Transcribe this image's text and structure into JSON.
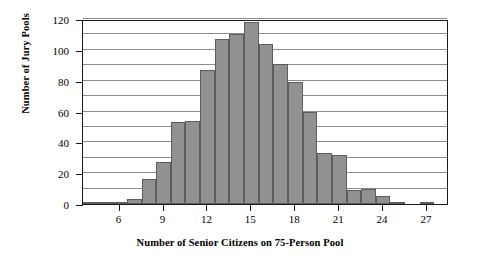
{
  "chart_data": {
    "type": "bar",
    "title": "",
    "xlabel": "Number of Senior Citizens on 75-Person Pool",
    "ylabel": "Number of Jury Pools",
    "xlim": [
      3.5,
      28.5
    ],
    "ylim": [
      0,
      120
    ],
    "grid": true,
    "legend": "none",
    "bar_color": "#919191",
    "bar_edge_color": "#5d5d5d",
    "axis_color": "#1a1a1a",
    "gridline_color": "#8c8c8c",
    "y_tick_labels": [
      "0",
      "20",
      "40",
      "60",
      "80",
      "100",
      "120"
    ],
    "y_ticks": [
      0,
      20,
      40,
      60,
      80,
      100,
      120
    ],
    "y_gridlines": [
      10,
      20,
      30,
      40,
      50,
      60,
      70,
      80,
      90,
      100,
      110,
      120
    ],
    "x_tick_labels": [
      "6",
      "9",
      "12",
      "15",
      "18",
      "21",
      "24",
      "27"
    ],
    "x_ticks": [
      6,
      9,
      12,
      15,
      18,
      21,
      24,
      27
    ],
    "categories": [
      4,
      5,
      6,
      7,
      8,
      9,
      10,
      11,
      12,
      13,
      14,
      15,
      16,
      17,
      18,
      19,
      20,
      21,
      22,
      23,
      24,
      25,
      26,
      27
    ],
    "values": [
      1,
      1,
      1,
      3,
      16,
      27,
      53,
      54,
      87,
      107,
      110,
      118,
      104,
      91,
      79,
      60,
      33,
      32,
      9,
      10,
      5,
      1,
      0,
      1
    ]
  }
}
